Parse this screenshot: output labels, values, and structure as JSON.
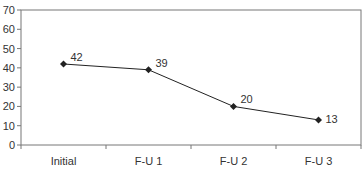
{
  "chart_data": {
    "type": "line",
    "title": "",
    "xlabel": "",
    "ylabel": "",
    "categories": [
      "Initial",
      "F-U 1",
      "F-U 2",
      "F-U 3"
    ],
    "series": [
      {
        "name": "Series 1",
        "values": [
          42,
          39,
          20,
          13
        ],
        "marker": "diamond",
        "color": "#222222"
      }
    ],
    "data_labels": [
      "42",
      "39",
      "20",
      "13"
    ],
    "ylim": [
      0,
      70
    ],
    "yticks": [
      "0",
      "10",
      "20",
      "30",
      "40",
      "50",
      "60",
      "70"
    ],
    "grid": false,
    "legend": "none"
  }
}
